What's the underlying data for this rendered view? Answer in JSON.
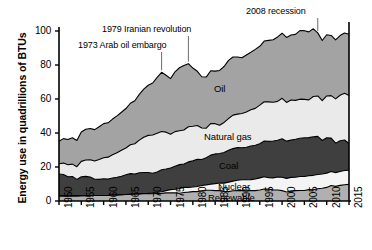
{
  "chart_data": {
    "type": "area",
    "stacked": true,
    "title": "",
    "xlabel": "",
    "ylabel": "Energy use in quadrillions of BTUs",
    "xlim": [
      1950,
      2015
    ],
    "ylim": [
      0,
      100
    ],
    "grid": false,
    "legend_position": "inline-labels",
    "x_ticks": [
      "1950",
      "1955",
      "1960",
      "1965",
      "1970",
      "1975",
      "1980",
      "1985",
      "1990",
      "1995",
      "2000",
      "2005",
      "2010",
      "2015"
    ],
    "y_ticks": [
      "0",
      "20",
      "40",
      "60",
      "80",
      "100"
    ],
    "x": [
      1950,
      1951,
      1952,
      1953,
      1954,
      1955,
      1956,
      1957,
      1958,
      1959,
      1960,
      1961,
      1962,
      1963,
      1964,
      1965,
      1966,
      1967,
      1968,
      1969,
      1970,
      1971,
      1972,
      1973,
      1974,
      1975,
      1976,
      1977,
      1978,
      1979,
      1980,
      1981,
      1982,
      1983,
      1984,
      1985,
      1986,
      1987,
      1988,
      1989,
      1990,
      1991,
      1992,
      1993,
      1994,
      1995,
      1996,
      1997,
      1998,
      1999,
      2000,
      2001,
      2002,
      2003,
      2004,
      2005,
      2006,
      2007,
      2008,
      2009,
      2010,
      2011,
      2012,
      2013,
      2014,
      2015
    ],
    "series": [
      {
        "name": "Renewable",
        "color": "#b0b0b0",
        "values": [
          3.0,
          3.0,
          3.0,
          3.0,
          3.0,
          3.1,
          3.1,
          3.1,
          3.2,
          3.2,
          3.2,
          3.3,
          3.5,
          3.6,
          3.7,
          3.8,
          4.0,
          4.1,
          4.2,
          4.3,
          4.3,
          4.3,
          4.4,
          4.5,
          4.8,
          4.8,
          4.8,
          4.6,
          5.0,
          5.2,
          5.5,
          5.5,
          6.0,
          6.3,
          6.3,
          6.1,
          6.1,
          5.6,
          5.5,
          6.0,
          6.1,
          6.1,
          6.0,
          6.1,
          6.1,
          6.5,
          7.1,
          7.0,
          6.5,
          6.5,
          6.1,
          5.3,
          5.8,
          6.1,
          6.2,
          6.2,
          6.7,
          6.6,
          7.2,
          7.5,
          8.0,
          9.1,
          8.6,
          9.2,
          9.6,
          9.8
        ]
      },
      {
        "name": "Nuclear",
        "color": "#f4f4f4",
        "values": [
          0.0,
          0.0,
          0.0,
          0.0,
          0.0,
          0.0,
          0.0,
          0.0,
          0.0,
          0.0,
          0.0,
          0.0,
          0.0,
          0.0,
          0.0,
          0.0,
          0.0,
          0.1,
          0.1,
          0.1,
          0.2,
          0.4,
          0.6,
          0.9,
          1.3,
          1.9,
          2.1,
          2.7,
          3.0,
          2.8,
          2.7,
          3.0,
          3.1,
          3.2,
          3.6,
          4.1,
          4.5,
          4.9,
          5.6,
          5.7,
          6.1,
          6.4,
          6.5,
          6.5,
          6.8,
          7.1,
          7.2,
          6.7,
          7.1,
          7.6,
          7.9,
          8.0,
          8.1,
          7.9,
          8.2,
          8.2,
          8.2,
          8.5,
          8.4,
          8.4,
          8.4,
          8.3,
          8.1,
          8.2,
          8.3,
          8.3
        ]
      },
      {
        "name": "Coal",
        "color": "#3f3f3f",
        "values": [
          12.9,
          12.6,
          11.3,
          11.4,
          9.7,
          11.2,
          11.4,
          11.0,
          9.6,
          9.5,
          9.8,
          9.6,
          10.0,
          10.4,
          10.9,
          11.6,
          12.1,
          11.6,
          12.3,
          12.4,
          12.3,
          11.6,
          12.1,
          13.0,
          12.7,
          12.7,
          13.6,
          14.1,
          13.8,
          15.0,
          15.4,
          16.0,
          15.3,
          15.9,
          17.1,
          17.5,
          17.3,
          18.0,
          18.8,
          19.1,
          19.2,
          18.8,
          19.1,
          19.8,
          19.9,
          20.1,
          21.0,
          21.4,
          21.7,
          21.6,
          22.6,
          21.9,
          21.9,
          22.3,
          22.5,
          22.8,
          22.4,
          22.7,
          22.4,
          19.7,
          20.8,
          19.6,
          17.3,
          18.0,
          18.0,
          15.7
        ]
      },
      {
        "name": "Natural gas",
        "color": "#eaeaea",
        "values": [
          6.0,
          6.7,
          7.0,
          7.3,
          7.5,
          9.0,
          9.6,
          10.2,
          10.7,
          11.7,
          12.4,
          12.9,
          13.7,
          14.4,
          15.3,
          15.8,
          17.0,
          17.9,
          19.2,
          20.7,
          21.8,
          22.5,
          22.7,
          22.5,
          21.7,
          19.9,
          20.3,
          19.9,
          20.0,
          20.7,
          20.4,
          19.9,
          18.5,
          17.4,
          18.5,
          17.8,
          16.7,
          17.7,
          18.6,
          19.7,
          19.7,
          20.2,
          20.8,
          21.3,
          21.7,
          22.7,
          23.1,
          23.2,
          22.8,
          22.9,
          23.8,
          22.8,
          23.6,
          22.9,
          23.0,
          22.6,
          22.2,
          23.7,
          23.8,
          23.4,
          24.6,
          25.0,
          26.1,
          26.8,
          27.5,
          28.3
        ]
      },
      {
        "name": "Oil",
        "color": "#a3a3a3",
        "values": [
          13.3,
          14.4,
          14.9,
          15.5,
          15.4,
          17.3,
          18.1,
          18.3,
          18.5,
          19.3,
          20.1,
          20.2,
          21.0,
          21.7,
          22.3,
          23.2,
          24.4,
          25.3,
          26.9,
          28.3,
          29.5,
          30.6,
          32.9,
          34.8,
          33.5,
          32.7,
          35.2,
          37.1,
          37.9,
          37.1,
          34.2,
          31.9,
          30.2,
          30.1,
          31.1,
          30.9,
          32.2,
          32.9,
          34.2,
          34.2,
          33.6,
          32.8,
          33.5,
          33.8,
          34.7,
          34.6,
          35.7,
          36.2,
          36.8,
          37.9,
          38.3,
          38.2,
          38.2,
          38.8,
          40.3,
          40.4,
          40.0,
          39.8,
          37.1,
          35.4,
          36.0,
          35.4,
          34.7,
          35.1,
          35.4,
          36.0
        ]
      }
    ],
    "annotations": [
      {
        "text": "1973 Arab oil embargo",
        "x": 1973,
        "label_x_px": 78,
        "label_y_px": 40
      },
      {
        "text": "1979 Iranian revolution",
        "x": 1979,
        "label_x_px": 102,
        "label_y_px": 24
      },
      {
        "text": "2008 recession",
        "x": 2008,
        "label_x_px": 246,
        "label_y_px": 6
      }
    ]
  },
  "plot_geometry": {
    "left_px": 59,
    "right_px": 349,
    "top_px": 31,
    "bottom_px": 201
  }
}
